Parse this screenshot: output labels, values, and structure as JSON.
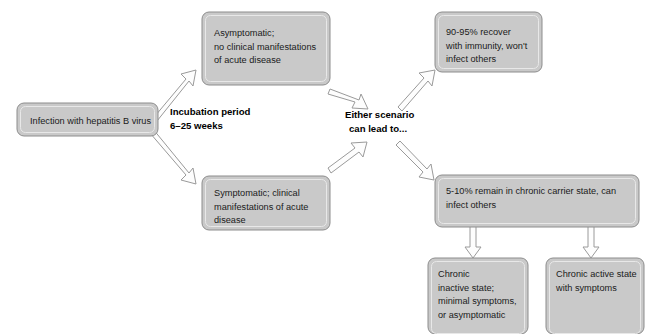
{
  "diagram": {
    "colors": {
      "box_fill": "#c9c9c9",
      "box_stroke": "#8d8d8d",
      "arrow_fill": "#fdfdfd",
      "arrow_stroke": "#9a9a9a",
      "text": "#1a1a1a",
      "background": "#ffffff"
    },
    "nodes": [
      {
        "id": "infection",
        "name": "infection-node",
        "lines": [
          "Infection with hepatitis B virus"
        ]
      },
      {
        "id": "asymptomatic",
        "name": "asymptomatic-node",
        "lines": [
          "Asymptomatic;",
          "no clinical manifestations",
          "of acute disease"
        ]
      },
      {
        "id": "symptomatic",
        "name": "symptomatic-node",
        "lines": [
          "Symptomatic; clinical",
          "manifestations of acute",
          "disease"
        ]
      },
      {
        "id": "recover",
        "name": "recover-node",
        "lines": [
          "90-95%  recover",
          "with immunity, won't",
          "infect others"
        ]
      },
      {
        "id": "carrier",
        "name": "chronic-carrier-node",
        "lines": [
          "5-10%  remain in chronic carrier state, can",
          "infect others"
        ]
      },
      {
        "id": "chronic-inactive",
        "name": "chronic-inactive-node",
        "lines": [
          "Chronic",
          "inactive state;",
          "minimal symptoms,",
          "or asymptomatic"
        ]
      },
      {
        "id": "chronic-active",
        "name": "chronic-active-node",
        "lines": [
          "Chronic active state",
          "with symptoms"
        ]
      }
    ],
    "labels": [
      {
        "id": "incubation",
        "name": "incubation-period-label",
        "lines": [
          "Incubation period",
          "6–25 weeks"
        ]
      },
      {
        "id": "either",
        "name": "either-scenario-label",
        "lines": [
          "Either scenario",
          "can lead to..."
        ]
      }
    ],
    "arrows": [
      {
        "id": "a1",
        "name": "arrow-infection-to-asymptomatic"
      },
      {
        "id": "a2",
        "name": "arrow-infection-to-symptomatic"
      },
      {
        "id": "a3",
        "name": "arrow-asymptomatic-to-either"
      },
      {
        "id": "a4",
        "name": "arrow-symptomatic-to-either"
      },
      {
        "id": "a5",
        "name": "arrow-either-to-recover"
      },
      {
        "id": "a6",
        "name": "arrow-either-to-carrier"
      },
      {
        "id": "a7",
        "name": "arrow-carrier-to-chronic-inactive"
      },
      {
        "id": "a8",
        "name": "arrow-carrier-to-chronic-active"
      }
    ]
  }
}
